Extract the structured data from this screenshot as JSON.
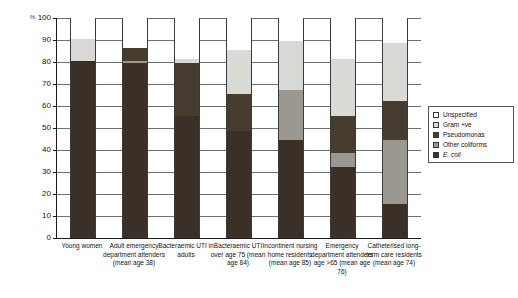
{
  "chart_data": {
    "type": "bar",
    "subtype": "stacked-percentage",
    "title": "",
    "xlabel": "",
    "ylabel": "%",
    "ylim": [
      0,
      100
    ],
    "ytick_labels": [
      "0",
      "10",
      "20",
      "30",
      "40",
      "50",
      "60",
      "70",
      "80",
      "90",
      "100"
    ],
    "ytick_values": [
      0,
      10,
      20,
      30,
      40,
      50,
      60,
      70,
      80,
      90,
      100
    ],
    "grid": true,
    "legend_position": "right",
    "categories": [
      "Young women",
      "Adult emergency department attenders (mean age 38)",
      "Bacteraemic UTI in adults",
      "Bacteraemic UTI over age 75 (mean age 84)",
      "Incontinent nursing home residents (mean age 85)",
      "Emergency department attenders age >65 (mean age 76)",
      "Catheterised long-term care residents (mean age 74)"
    ],
    "series": [
      {
        "name": "E. coli",
        "color": "#3a3027",
        "values": [
          80,
          79,
          55,
          48,
          44,
          32,
          15
        ]
      },
      {
        "name": "Other coliforms",
        "color": "#9b9791",
        "values": [
          0,
          1,
          0,
          0,
          23,
          6,
          29
        ]
      },
      {
        "name": "Pseudomonas",
        "color": "#463c30",
        "values": [
          0,
          6,
          24,
          17,
          0,
          17,
          18
        ]
      },
      {
        "name": "Gram +ve",
        "color": "#d9d9d6",
        "values": [
          10,
          0,
          2,
          20,
          22,
          26,
          26
        ]
      },
      {
        "name": "Unspecified",
        "color": "#ffffff",
        "values": [
          10,
          14,
          19,
          15,
          11,
          19,
          12
        ]
      }
    ]
  },
  "legend": {
    "items": [
      {
        "label": "Unspecified",
        "color": "#ffffff",
        "italic": false
      },
      {
        "label": "Gram +ve",
        "color": "#d9d9d6",
        "italic": false
      },
      {
        "label": "Pseudomonas",
        "color": "#463c30",
        "italic": false
      },
      {
        "label": "Other coliforms",
        "color": "#9b9791",
        "italic": false
      },
      {
        "label": "E. coli",
        "color": "#3a3027",
        "italic": true
      }
    ]
  }
}
